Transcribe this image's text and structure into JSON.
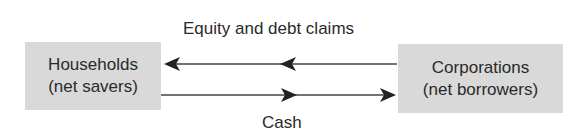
{
  "diagram": {
    "nodes": {
      "households": {
        "line1": "Households",
        "line2": "(net savers)"
      },
      "corporations": {
        "line1": "Corporations",
        "line2": "(net borrowers)"
      }
    },
    "flows": {
      "claims": {
        "label": "Equity and debt claims",
        "direction": "corporations-to-households"
      },
      "cash": {
        "label": "Cash",
        "direction": "households-to-corporations"
      }
    },
    "colors": {
      "box_fill": "#d9d9d9",
      "arrow": "#333333",
      "text": "#2a2a2a"
    }
  }
}
